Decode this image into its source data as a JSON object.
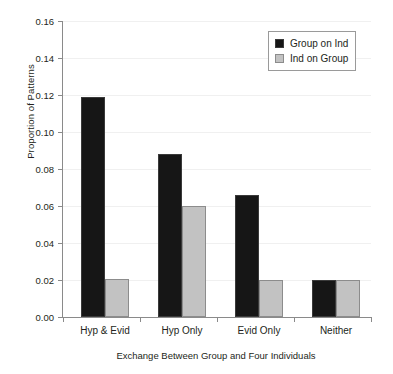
{
  "chart_data": {
    "type": "bar",
    "title": "",
    "xlabel": "Exchange Between Group and Four Individuals",
    "ylabel": "Proportion of Patterns",
    "categories": [
      "Hyp & Evid",
      "Hyp Only",
      "Evid Only",
      "Neither"
    ],
    "series": [
      {
        "name": "Group on Ind",
        "color": "#161616",
        "values": [
          0.119,
          0.088,
          0.066,
          0.02
        ]
      },
      {
        "name": "Ind on Group",
        "color": "#c2c2c2",
        "values": [
          0.0205,
          0.06,
          0.02,
          0.02
        ]
      }
    ],
    "ylim": [
      0.0,
      0.16
    ],
    "ytick_labels": [
      "0.16",
      "0.14",
      "0.12",
      "0.10",
      "0.08",
      "0.06",
      "0.04",
      "0.02",
      "0.00"
    ],
    "ytick_values": [
      0.16,
      0.14,
      0.12,
      0.1,
      0.08,
      0.06,
      0.04,
      0.02,
      0.0
    ],
    "ytick_step": 0.02,
    "grid": true,
    "legend_position": "top-right",
    "legend_entries": [
      "Group on Ind",
      "Ind on Group"
    ]
  }
}
